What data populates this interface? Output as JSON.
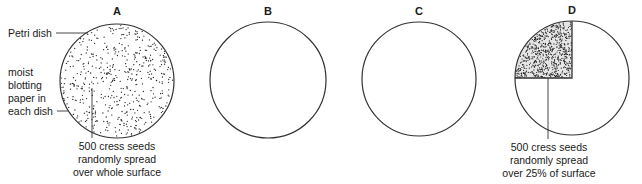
{
  "figure": {
    "dishes": [
      {
        "id": "A",
        "label": "A",
        "seeded": "full"
      },
      {
        "id": "B",
        "label": "B",
        "seeded": "none"
      },
      {
        "id": "C",
        "label": "C",
        "seeded": "none"
      },
      {
        "id": "D",
        "label": "D",
        "seeded": "quarter"
      }
    ],
    "annotations": {
      "petri_dish": "Petri dish",
      "blotting_paper": [
        "moist",
        "blotting",
        "paper in",
        "each dish"
      ],
      "dish_a_seeds": [
        "500 cress seeds",
        "randomly spread",
        "over whole surface"
      ],
      "dish_d_seeds": [
        "500 cress seeds",
        "randomly spread",
        "over 25% of surface"
      ]
    }
  },
  "colors": {
    "outline": "#333333",
    "seed": "#222222",
    "text": "#1a1a1a"
  }
}
